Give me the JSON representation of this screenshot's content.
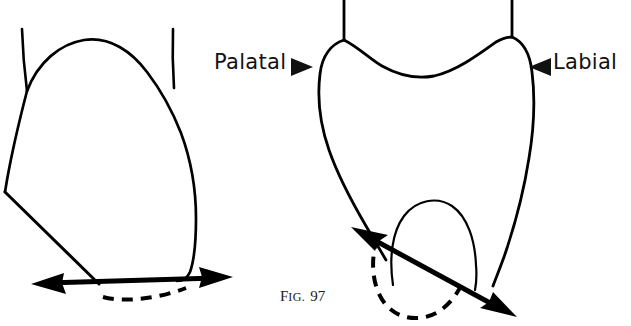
{
  "figure": {
    "caption_prefix": "F",
    "caption_prefix_small": "IG.",
    "caption_number": "97",
    "caption_full": "FIG. 97",
    "line_color": "#000000",
    "background_color": "#ffffff",
    "text_color": "#111111"
  },
  "labels": {
    "palatal": "Palatal",
    "labial": "Labial"
  },
  "annotations": {
    "palatal_marker": "right-pointing-triangle",
    "labial_marker": "left-pointing-triangle"
  },
  "diagrams": [
    {
      "name": "proximal-view-tooth",
      "position": "left",
      "description": "Proximal outline of tooth crown with two root outlines above and a horizontal double-headed arrow with dashed curve at the cervical line"
    },
    {
      "name": "facial-view-tooth",
      "position": "right",
      "description": "Labial-palatal outline of tooth crown with concave incisal edge, two root outlines above, inner arch at the cusp and a diagonal double-headed arrow with dashed curve"
    }
  ]
}
